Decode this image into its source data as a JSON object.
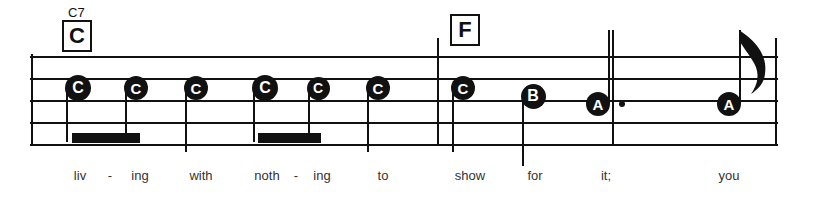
{
  "sheet": {
    "staff": {
      "left": 30,
      "right": 778,
      "line_ys": [
        56,
        78,
        100,
        122,
        144
      ],
      "line_count": 5
    },
    "barlines": [
      {
        "name": "opening-barline",
        "x": 31,
        "top": 54,
        "bottom": 146
      },
      {
        "name": "measure-barline",
        "x": 437,
        "top": 38,
        "bottom": 146
      },
      {
        "name": "phrase-barline",
        "x": 612,
        "top": 30,
        "bottom": 146
      },
      {
        "name": "closing-barline",
        "x": 775,
        "top": 38,
        "bottom": 146
      }
    ],
    "chords": [
      {
        "name": "chord-c7",
        "label": "C",
        "superscript": "C7",
        "x": 62,
        "y": 20,
        "sup_x": 68,
        "sup_y": 6
      },
      {
        "name": "chord-f",
        "label": "F",
        "superscript": "",
        "x": 450,
        "y": 14,
        "sup_x": 0,
        "sup_y": 0
      }
    ],
    "notes": [
      {
        "name": "note-1",
        "letter": "C",
        "x": 78,
        "y": 88,
        "size": 26,
        "stem": "down",
        "stem_to": 142,
        "dotted": false,
        "flag": false
      },
      {
        "name": "note-2",
        "letter": "C",
        "x": 136,
        "y": 88,
        "size": 24,
        "stem": "down",
        "stem_to": 142,
        "dotted": false,
        "flag": false
      },
      {
        "name": "note-3",
        "letter": "C",
        "x": 196,
        "y": 88,
        "size": 24,
        "stem": "down",
        "stem_to": 152,
        "dotted": false,
        "flag": false
      },
      {
        "name": "note-4",
        "letter": "C",
        "x": 265,
        "y": 88,
        "size": 26,
        "stem": "down",
        "stem_to": 142,
        "dotted": false,
        "flag": false
      },
      {
        "name": "note-5",
        "letter": "C",
        "x": 318,
        "y": 88,
        "size": 23,
        "stem": "down",
        "stem_to": 142,
        "dotted": false,
        "flag": false
      },
      {
        "name": "note-6",
        "letter": "C",
        "x": 378,
        "y": 88,
        "size": 24,
        "stem": "down",
        "stem_to": 152,
        "dotted": false,
        "flag": false
      },
      {
        "name": "note-7",
        "letter": "C",
        "x": 463,
        "y": 88,
        "size": 24,
        "stem": "down",
        "stem_to": 152,
        "dotted": false,
        "flag": false
      },
      {
        "name": "note-8",
        "letter": "B",
        "x": 533,
        "y": 96,
        "size": 25,
        "stem": "down",
        "stem_to": 166,
        "dotted": false,
        "flag": false
      },
      {
        "name": "note-9",
        "letter": "A",
        "x": 598,
        "y": 104,
        "size": 24,
        "stem": "up",
        "stem_to": 30,
        "dotted": true,
        "flag": false
      },
      {
        "name": "note-10",
        "letter": "A",
        "x": 729,
        "y": 104,
        "size": 24,
        "stem": "up",
        "stem_to": 30,
        "dotted": false,
        "flag": true
      }
    ],
    "beams": [
      {
        "name": "beam-1",
        "x": 72,
        "y": 133,
        "width": 68,
        "height": 10
      },
      {
        "name": "beam-2",
        "x": 258,
        "y": 133,
        "width": 63,
        "height": 10
      }
    ],
    "lyrics": [
      {
        "name": "lyric-liv",
        "text": "liv",
        "x": 80,
        "y": 168
      },
      {
        "name": "lyric-hyphen-1",
        "text": "-",
        "x": 110,
        "y": 168
      },
      {
        "name": "lyric-ing-1",
        "text": "ing",
        "x": 140,
        "y": 168
      },
      {
        "name": "lyric-with",
        "text": "with",
        "x": 201,
        "y": 168
      },
      {
        "name": "lyric-noth",
        "text": "noth",
        "x": 267,
        "y": 168
      },
      {
        "name": "lyric-hyphen-2",
        "text": "-",
        "x": 296,
        "y": 168
      },
      {
        "name": "lyric-ing-2",
        "text": "ing",
        "x": 322,
        "y": 168
      },
      {
        "name": "lyric-to",
        "text": "to",
        "x": 383,
        "y": 168
      },
      {
        "name": "lyric-show",
        "text": "show",
        "x": 470,
        "y": 168
      },
      {
        "name": "lyric-for",
        "text": "for",
        "x": 535,
        "y": 168
      },
      {
        "name": "lyric-it",
        "text": "it;",
        "x": 606,
        "y": 168
      },
      {
        "name": "lyric-you",
        "text": "you",
        "x": 729,
        "y": 168
      }
    ]
  }
}
